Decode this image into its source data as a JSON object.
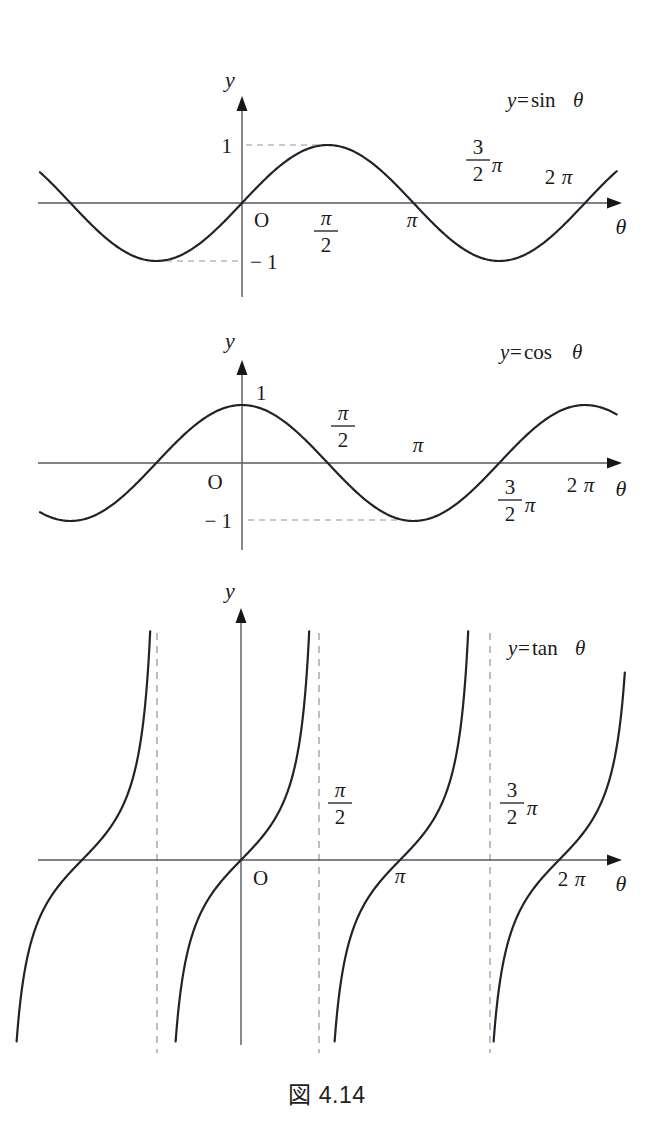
{
  "figure": {
    "caption": "図 4.14",
    "axis_names": {
      "y": "y",
      "theta": "θ"
    },
    "origin_label": "O"
  },
  "panels": [
    {
      "id": "sin",
      "equation": "y = sin θ",
      "equation_parts": {
        "lhs": "y",
        "eq": "=",
        "fn": "sin",
        "arg": "θ"
      },
      "y_ticks": [
        {
          "label": "1",
          "value": 1
        },
        {
          "label": "− 1",
          "value": -1
        }
      ],
      "x_ticks": [
        {
          "label_num": "π",
          "label_den": "2",
          "suffix": "",
          "value": 1.5707963
        },
        {
          "label_num": "π",
          "label_den": "",
          "suffix": "",
          "value": 3.1415927
        },
        {
          "label_num": "3",
          "label_den": "2",
          "suffix": "π",
          "value": 4.712389
        },
        {
          "label_num": "2",
          "label_den": "",
          "suffix": "π",
          "value": 6.2831853
        }
      ],
      "dashed_guides": [
        "y=1 to peak",
        "y=-1 to trough"
      ]
    },
    {
      "id": "cos",
      "equation": "y = cos θ",
      "equation_parts": {
        "lhs": "y",
        "eq": "=",
        "fn": "cos",
        "arg": "θ"
      },
      "y_ticks": [
        {
          "label": "1",
          "value": 1
        },
        {
          "label": "− 1",
          "value": -1
        }
      ],
      "x_ticks": [
        {
          "label_num": "π",
          "label_den": "2",
          "suffix": "",
          "value": 1.5707963
        },
        {
          "label_num": "π",
          "label_den": "",
          "suffix": "",
          "value": 3.1415927
        },
        {
          "label_num": "3",
          "label_den": "2",
          "suffix": "π",
          "value": 4.712389
        },
        {
          "label_num": "2",
          "label_den": "",
          "suffix": "π",
          "value": 6.2831853
        }
      ],
      "dashed_guides": [
        "y=-1 horizontal to trough"
      ]
    },
    {
      "id": "tan",
      "equation": "y = tanθ",
      "equation_parts": {
        "lhs": "y",
        "eq": "=",
        "fn": "tan",
        "arg": "θ"
      },
      "y_ticks": [],
      "x_ticks": [
        {
          "label_num": "π",
          "label_den": "2",
          "suffix": "",
          "value": 1.5707963
        },
        {
          "label_num": "π",
          "label_den": "",
          "suffix": "",
          "value": 3.1415927
        },
        {
          "label_num": "3",
          "label_den": "2",
          "suffix": "π",
          "value": 4.712389
        },
        {
          "label_num": "2",
          "label_den": "",
          "suffix": "π",
          "value": 6.2831853
        }
      ],
      "asymptotes": [
        -1.5707963,
        1.5707963,
        4.712389
      ]
    }
  ],
  "chart_data": [
    {
      "type": "line",
      "title": "y = sin θ",
      "xlabel": "θ",
      "ylabel": "y",
      "xlim": [
        -1.18,
        2.2
      ],
      "xlim_units": "pi",
      "ylim": [
        -1.45,
        1.45
      ],
      "grid": false,
      "legend": "none",
      "series": [
        {
          "name": "sin",
          "function": "sin(theta)",
          "x_units": "radians",
          "key_points": [
            {
              "x": -3.1415927,
              "y": 0
            },
            {
              "x": -1.5707963,
              "y": -1
            },
            {
              "x": 0,
              "y": 0
            },
            {
              "x": 1.5707963,
              "y": 1
            },
            {
              "x": 3.1415927,
              "y": 0
            },
            {
              "x": 4.712389,
              "y": -1
            },
            {
              "x": 6.2831853,
              "y": 0
            }
          ]
        }
      ],
      "annotations": [
        "1",
        "− 1",
        "O",
        "π/2",
        "π",
        "3/2 π",
        "2 π"
      ]
    },
    {
      "type": "line",
      "title": "y = cos θ",
      "xlabel": "θ",
      "ylabel": "y",
      "xlim": [
        -1.18,
        2.2
      ],
      "xlim_units": "pi",
      "ylim": [
        -1.45,
        1.45
      ],
      "grid": false,
      "legend": "none",
      "series": [
        {
          "name": "cos",
          "function": "cos(theta)",
          "x_units": "radians",
          "key_points": [
            {
              "x": -3.1415927,
              "y": -1
            },
            {
              "x": -1.5707963,
              "y": 0
            },
            {
              "x": 0,
              "y": 1
            },
            {
              "x": 1.5707963,
              "y": 0
            },
            {
              "x": 3.1415927,
              "y": -1
            },
            {
              "x": 4.712389,
              "y": 0
            },
            {
              "x": 6.2831853,
              "y": 1
            }
          ]
        }
      ],
      "annotations": [
        "1",
        "− 1",
        "O",
        "π/2",
        "π",
        "3/2 π",
        "2 π"
      ]
    },
    {
      "type": "line",
      "title": "y = tanθ",
      "xlabel": "θ",
      "ylabel": "y",
      "xlim": [
        -1.18,
        2.2
      ],
      "xlim_units": "pi",
      "ylim": [
        -6.5,
        6.5
      ],
      "grid": false,
      "legend": "none",
      "series": [
        {
          "name": "tan",
          "function": "tan(theta)",
          "x_units": "radians",
          "zeros": [
            -3.1415927,
            0,
            3.1415927,
            6.2831853
          ],
          "asymptotes": [
            -1.5707963,
            1.5707963,
            4.712389
          ]
        }
      ],
      "annotations": [
        "O",
        "π/2",
        "π",
        "3/2 π",
        "2 π"
      ]
    }
  ]
}
